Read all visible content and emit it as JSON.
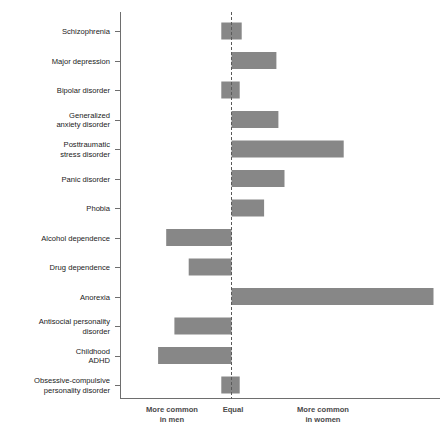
{
  "chart_data": {
    "type": "bar",
    "orientation": "horizontal",
    "title": "",
    "subtitle": "",
    "xlabel": "",
    "ylabel": "",
    "grid": false,
    "legend": false,
    "zero_reference": "Equal",
    "xlim": [
      -1.0,
      1.0
    ],
    "x_axis_captions": [
      {
        "line1": "More common",
        "line2": "in men"
      },
      {
        "line1": "Equal",
        "line2": ""
      },
      {
        "line1": "More common",
        "line2": "in women"
      }
    ],
    "categories": [
      "Schizophrenia",
      "Major depression",
      "Bipolar disorder",
      "Generalized anxiety disorder",
      "Posttraumatic stress disorder",
      "Panic disorder",
      "Phobia",
      "Alcohol dependence",
      "Drug dependence",
      "Anorexia",
      "Antisocial personality disorder",
      "Childhood ADHD",
      "Obsessive-compulsive personality disorder"
    ],
    "category_label_lines": [
      [
        "Schizophrenia"
      ],
      [
        "Major depression"
      ],
      [
        "Bipolar disorder"
      ],
      [
        "Generalized",
        "anxiety disorder"
      ],
      [
        "Posttraumatic",
        "stress disorder"
      ],
      [
        "Panic disorder"
      ],
      [
        "Phobia"
      ],
      [
        "Alcohol dependence"
      ],
      [
        "Drug dependence"
      ],
      [
        "Anorexia"
      ],
      [
        "Antisocial personality",
        "disorder"
      ],
      [
        "Childhood",
        "ADHD"
      ],
      [
        "Obsessive-compulsive",
        "personality disorder"
      ]
    ],
    "values": [
      0.05,
      0.22,
      0.04,
      0.23,
      0.55,
      0.26,
      0.16,
      -0.32,
      -0.21,
      0.99,
      -0.28,
      -0.36,
      0.04
    ],
    "bar_starts": [
      -0.05,
      0.0,
      -0.05,
      0.0,
      0.0,
      0.0,
      0.0,
      -0.32,
      -0.21,
      0.0,
      -0.28,
      -0.36,
      -0.05
    ],
    "bar_ends": [
      0.05,
      0.22,
      0.04,
      0.23,
      0.55,
      0.26,
      0.16,
      0.0,
      0.0,
      0.99,
      0.0,
      0.0,
      0.04
    ]
  },
  "colors": {
    "bar_fill": "#878787",
    "axis": "#6e6e6e",
    "zero_line": "#5a5a5a",
    "label_text": "#1a1a1a",
    "caption_text": "#4a4a4a",
    "background": "#ffffff"
  }
}
